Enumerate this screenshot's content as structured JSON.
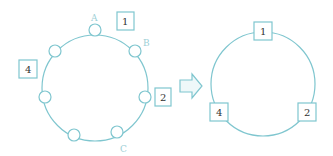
{
  "colors": {
    "line": "#7fc6cf",
    "text": "#333333",
    "letter": "#9ccfd6",
    "arrow_fill": "#eef8f9"
  },
  "left_diagram": {
    "letters": {
      "A": "A",
      "B": "B",
      "C": "C"
    },
    "boxes": {
      "b1": "1",
      "b2": "2",
      "b4": "4"
    },
    "node_count": 7
  },
  "right_diagram": {
    "boxes": {
      "b1": "1",
      "b2": "2",
      "b4": "4"
    }
  },
  "arrow": {
    "direction": "right"
  }
}
